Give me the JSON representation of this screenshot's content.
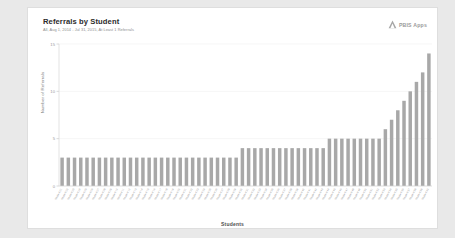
{
  "card": {
    "title": "Referrals by Student",
    "subtitle": "All, Aug 1, 2014 - Jul 31, 2015, At Least 1 Referrals",
    "brand": {
      "name": "PBIS Apps",
      "mark": "mountain-logo-icon"
    }
  },
  "chart_data": {
    "type": "bar",
    "title": "Referrals by Student",
    "subtitle": "All, Aug 1, 2014 - Jul 31, 2015, At Least 1 Referrals",
    "xlabel": "Students",
    "ylabel": "Number of Referrals",
    "ylim": [
      0,
      15
    ],
    "yticks": [
      0,
      5,
      10,
      15
    ],
    "ytick_labels": [
      "0",
      "5",
      "10",
      "15"
    ],
    "grid": true,
    "legend": false,
    "bar_color": "#a8a8a8",
    "categories": [
      "Student 01",
      "Student 02",
      "Student 03",
      "Student 04",
      "Student 05",
      "Student 06",
      "Student 07",
      "Student 08",
      "Student 09",
      "Student 10",
      "Student 11",
      "Student 12",
      "Student 13",
      "Student 14",
      "Student 15",
      "Student 16",
      "Student 17",
      "Student 18",
      "Student 19",
      "Student 20",
      "Student 21",
      "Student 22",
      "Student 23",
      "Student 24",
      "Student 25",
      "Student 26",
      "Student 27",
      "Student 28",
      "Student 29",
      "Student 30",
      "Student 31",
      "Student 32",
      "Student 33",
      "Student 34",
      "Student 35",
      "Student 36",
      "Student 37",
      "Student 38",
      "Student 39",
      "Student 40",
      "Student 41",
      "Student 42",
      "Student 43",
      "Student 44",
      "Student 45",
      "Student 46",
      "Student 47",
      "Student 48",
      "Student 49",
      "Student 50",
      "Student 51",
      "Student 52",
      "Student 53",
      "Student 54",
      "Student 55",
      "Student 56",
      "Student 57",
      "Student 58",
      "Student 59",
      "Student 60"
    ],
    "values": [
      3,
      3,
      3,
      3,
      3,
      3,
      3,
      3,
      3,
      3,
      3,
      3,
      3,
      3,
      3,
      3,
      3,
      3,
      3,
      3,
      3,
      3,
      3,
      3,
      3,
      3,
      3,
      3,
      3,
      4,
      4,
      4,
      4,
      4,
      4,
      4,
      4,
      4,
      4,
      4,
      4,
      4,
      4,
      5,
      5,
      5,
      5,
      5,
      5,
      5,
      5,
      5,
      6,
      7,
      8,
      9,
      10,
      11,
      12,
      14
    ]
  }
}
